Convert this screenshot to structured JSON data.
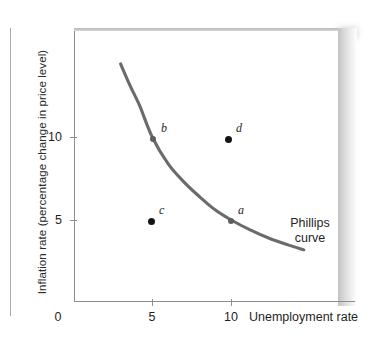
{
  "chart_data": {
    "type": "line",
    "title": "",
    "xlabel": "Unemployment rate",
    "ylabel": "Inflation rate (percentage change in price level)",
    "xlim": [
      0,
      17
    ],
    "ylim": [
      0,
      16
    ],
    "xticks": [
      "0",
      "5",
      "10"
    ],
    "xtick_values": [
      0,
      5,
      10
    ],
    "yticks": [
      "5",
      "10"
    ],
    "ytick_values": [
      5,
      10
    ],
    "grid": false,
    "legend": "none",
    "series": [
      {
        "name": "Phillips curve",
        "annotation": "Phillips\ncurve",
        "color": "#6b6b6b",
        "x": [
          3.0,
          3.6,
          4.2,
          5.0,
          6.0,
          7.0,
          8.0,
          9.0,
          10.0,
          11.2,
          12.4,
          13.6,
          14.6
        ],
        "y": [
          14.4,
          13.1,
          11.9,
          10.0,
          8.4,
          7.3,
          6.4,
          5.6,
          5.0,
          4.4,
          3.9,
          3.5,
          3.2
        ]
      }
    ],
    "points": [
      {
        "id": "a",
        "label": "a",
        "x": 10,
        "y": 5,
        "on_curve": true,
        "label_pos": "upper-right"
      },
      {
        "id": "b",
        "label": "b",
        "x": 5,
        "y": 10,
        "on_curve": true,
        "label_pos": "upper-right"
      },
      {
        "id": "c",
        "label": "c",
        "x": 5,
        "y": 5,
        "on_curve": false,
        "label_pos": "upper-right"
      },
      {
        "id": "d",
        "label": "d",
        "x": 10,
        "y": 10,
        "on_curve": false,
        "label_pos": "upper-right"
      }
    ]
  },
  "axis": {
    "y_title": "Inflation rate (percentage change in price level)",
    "x_title": "Unemployment rate",
    "y_tick_10": "10",
    "y_tick_5": "5",
    "x_tick_0": "0",
    "x_tick_5": "5",
    "x_tick_10": "10"
  },
  "labels": {
    "point_a": "a",
    "point_b": "b",
    "point_c": "c",
    "point_d": "d",
    "curve_line1": "Phillips",
    "curve_line2": "curve"
  },
  "colors": {
    "curve": "#6b6b6b",
    "dot": "#141414",
    "axis": "#8d8d8d",
    "text": "#1f1f1f",
    "panel_shadow": "#c5c5c5"
  }
}
